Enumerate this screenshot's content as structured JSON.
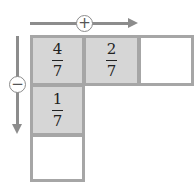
{
  "diagram": {
    "horizontal_arrow": {
      "sign": "+",
      "direction": "right"
    },
    "vertical_arrow": {
      "sign": "−",
      "direction": "down"
    },
    "cells": [
      {
        "row": 0,
        "col": 0,
        "numerator": "4",
        "denominator": "7",
        "filled": true
      },
      {
        "row": 0,
        "col": 1,
        "numerator": "2",
        "denominator": "7",
        "filled": true
      },
      {
        "row": 0,
        "col": 2,
        "numerator": "",
        "denominator": "",
        "filled": false
      },
      {
        "row": 1,
        "col": 0,
        "numerator": "1",
        "denominator": "7",
        "filled": true
      },
      {
        "row": 2,
        "col": 0,
        "numerator": "",
        "denominator": "",
        "filled": false
      }
    ],
    "colors": {
      "arrow": "#8c8c8c",
      "box_border": "#a6a6a6",
      "box_fill": "#d6d6d6"
    }
  }
}
